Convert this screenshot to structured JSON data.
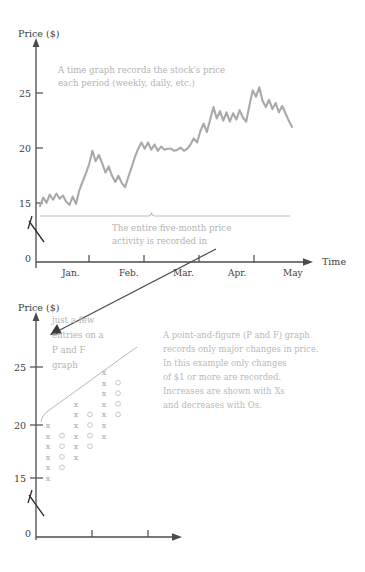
{
  "top_chart": {
    "y_axis_label": "Price ($)",
    "x_axis_label": "Time",
    "y_ticks": [
      "0",
      "15",
      "20",
      "25"
    ],
    "x_ticks": [
      "Jan.",
      "Feb.",
      "Mar.",
      "Apr.",
      "May"
    ],
    "annotation_line1": "A time graph records the stock's price",
    "annotation_line2": "each period (weekly, daily, etc.)",
    "brace_note_line1": "The entire five-month price",
    "brace_note_line2": "activity is recorded in"
  },
  "bottom_chart": {
    "y_axis_label": "Price ($)",
    "y_ticks": [
      "0",
      "15",
      "20",
      "25"
    ],
    "annotation_line1": "just a few",
    "annotation_line2": "entries on a",
    "annotation_line3": "P and F",
    "annotation_line4": "graph",
    "note_line1": "A point-and-figure (P and F) graph",
    "note_line2": "records only major changes in price.",
    "note_line3": "In this example only changes",
    "note_line4": "of $1 or more are recorded.",
    "note_line5": "Increases are shown with Xs",
    "note_line6": "and decreases with Os."
  },
  "chart_data": [
    {
      "type": "line",
      "id": "time-graph",
      "title": "A time graph records the stock's price each period (weekly, daily, etc.)",
      "xlabel": "Time",
      "ylabel": "Price ($)",
      "ylim": [
        14,
        27.5
      ],
      "yticks": [
        0,
        15,
        20,
        25
      ],
      "xticks": [
        "Jan.",
        "Feb.",
        "Mar.",
        "Apr.",
        "May"
      ],
      "grid": false,
      "legend": "none",
      "series": [
        {
          "name": "Stock price",
          "color": "#a9a9a9",
          "values": [
            15.1,
            15.9,
            15.4,
            16.2,
            15.7,
            16.3,
            15.8,
            16.1,
            15.5,
            15.2,
            16.0,
            15.3,
            16.6,
            17.4,
            18.2,
            19.1,
            20.4,
            19.4,
            20.0,
            19.2,
            18.3,
            18.9,
            18.0,
            17.4,
            18.0,
            17.3,
            16.9,
            17.9,
            18.8,
            19.8,
            20.6,
            21.2,
            20.6,
            21.2,
            20.5,
            21.0,
            20.4,
            20.8,
            20.5,
            20.6,
            20.6,
            20.4,
            20.5,
            20.7,
            20.4,
            20.6,
            21.0,
            21.6,
            21.2,
            22.3,
            23.0,
            22.2,
            23.4,
            24.6,
            23.5,
            24.2,
            23.3,
            24.1,
            23.2,
            24.0,
            23.4,
            24.3,
            23.6,
            23.2,
            24.8,
            26.2,
            25.6,
            26.5,
            25.2,
            24.6,
            25.3,
            24.4,
            25.0,
            24.1,
            24.7,
            24.0,
            23.3,
            22.7
          ]
        }
      ]
    },
    {
      "type": "scatter",
      "id": "point-and-figure-graph",
      "title": "A point-and-figure (P and F) graph records only major changes in price.",
      "xlabel": "",
      "ylabel": "Price ($)",
      "ylim": [
        14,
        27.5
      ],
      "yticks": [
        0,
        15,
        20,
        25
      ],
      "grid": false,
      "legend": "none",
      "marker_meaning": {
        "X": "increase of $1 or more",
        "O": "decrease of $1 or more"
      },
      "columns": [
        {
          "column": 1,
          "marks": [
            {
              "symbol": "X",
              "price": 15
            },
            {
              "symbol": "X",
              "price": 16
            },
            {
              "symbol": "X",
              "price": 17
            },
            {
              "symbol": "X",
              "price": 18
            },
            {
              "symbol": "X",
              "price": 19
            },
            {
              "symbol": "X",
              "price": 20
            }
          ]
        },
        {
          "column": 2,
          "marks": [
            {
              "symbol": "O",
              "price": 16
            },
            {
              "symbol": "O",
              "price": 17
            },
            {
              "symbol": "O",
              "price": 18
            },
            {
              "symbol": "O",
              "price": 19
            }
          ]
        },
        {
          "column": 3,
          "marks": [
            {
              "symbol": "X",
              "price": 17
            },
            {
              "symbol": "X",
              "price": 18
            },
            {
              "symbol": "X",
              "price": 19
            },
            {
              "symbol": "X",
              "price": 20
            },
            {
              "symbol": "X",
              "price": 21
            },
            {
              "symbol": "X",
              "price": 22
            }
          ]
        },
        {
          "column": 4,
          "marks": [
            {
              "symbol": "O",
              "price": 18
            },
            {
              "symbol": "O",
              "price": 19
            },
            {
              "symbol": "O",
              "price": 20
            },
            {
              "symbol": "O",
              "price": 21
            }
          ]
        },
        {
          "column": 5,
          "marks": [
            {
              "symbol": "X",
              "price": 19
            },
            {
              "symbol": "X",
              "price": 20
            },
            {
              "symbol": "X",
              "price": 21
            },
            {
              "symbol": "X",
              "price": 22
            },
            {
              "symbol": "X",
              "price": 23
            },
            {
              "symbol": "X",
              "price": 24
            },
            {
              "symbol": "X",
              "price": 25
            }
          ]
        },
        {
          "column": 6,
          "marks": [
            {
              "symbol": "O",
              "price": 21
            },
            {
              "symbol": "O",
              "price": 22
            },
            {
              "symbol": "O",
              "price": 23
            },
            {
              "symbol": "O",
              "price": 24
            }
          ]
        }
      ]
    }
  ]
}
